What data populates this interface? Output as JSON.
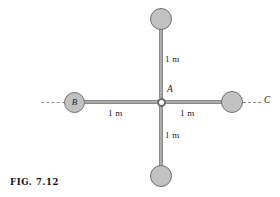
{
  "figure": {
    "caption": "FIG. 7.12"
  },
  "joint": {
    "label": "A",
    "name": "center-pin-joint"
  },
  "masses": [
    {
      "id": "top",
      "label": "",
      "name": "mass-top"
    },
    {
      "id": "bottom",
      "label": "",
      "name": "mass-bottom"
    },
    {
      "id": "left",
      "label": "B",
      "name": "mass-left-b"
    },
    {
      "id": "right",
      "label": "",
      "name": "mass-right-c"
    }
  ],
  "dimensions": [
    {
      "id": "top",
      "text": "1 m"
    },
    {
      "id": "left",
      "text": "1 m"
    },
    {
      "id": "right",
      "text": "1 m"
    },
    {
      "id": "bottom",
      "text": "1 m"
    }
  ],
  "axis_labels": [
    {
      "id": "left",
      "text": ""
    },
    {
      "id": "right",
      "text": "C"
    }
  ],
  "colors": {
    "rod": "#9a9a9a",
    "rod_highlight": "#b4b4b4",
    "ball_fill": "#c2c2c2",
    "ball_stroke": "#6f6f6f",
    "dash": "#8b8b8b",
    "text": "#1d1d1d",
    "background": "#ffffff"
  }
}
